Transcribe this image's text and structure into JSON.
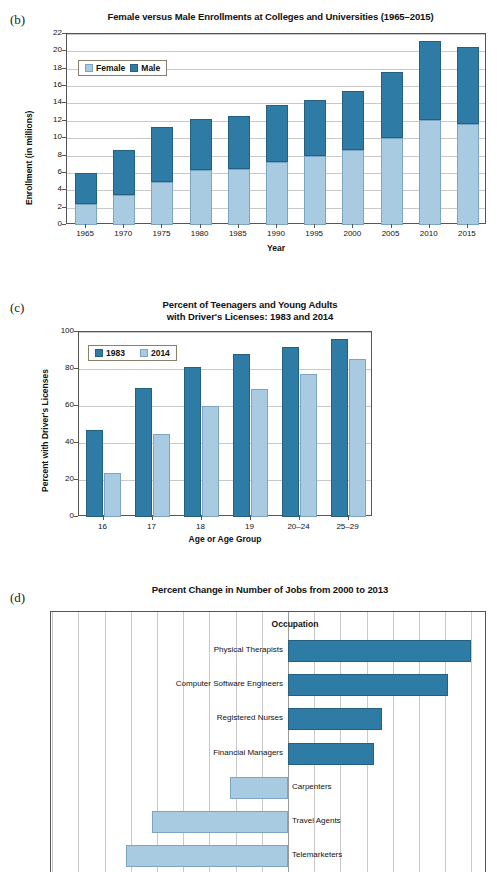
{
  "page": {
    "background": "#ffffff",
    "colors": {
      "dark_blue": "#2e7ba6",
      "light_blue": "#a8cbe2",
      "grid": "#c8c8c8",
      "axis": "#555555"
    }
  },
  "panel_b": {
    "tag": "(b)",
    "title": "Female versus Male Enrollments at Colleges and Universities (1965–2015)",
    "legend": [
      {
        "label": "Female",
        "color": "#a8cbe2"
      },
      {
        "label": "Male",
        "color": "#2e7ba6"
      }
    ],
    "ylabel": "Enrollment (in millions)",
    "xlabel": "Year"
  },
  "panel_c": {
    "tag": "(c)",
    "title_line1": "Percent of Teenagers and Young Adults",
    "title_line2": "with Driver's Licenses: 1983 and 2014",
    "legend": [
      {
        "label": "1983",
        "color": "#2e7ba6"
      },
      {
        "label": "2014",
        "color": "#a8cbe2"
      }
    ],
    "ylabel": "Percent with Driver's Licenses",
    "xlabel": "Age or Age Group"
  },
  "panel_d": {
    "tag": "(d)",
    "title": "Percent Change in Number of Jobs from 2000 to 2013",
    "column_header": "Occupation"
  },
  "chart_data": [
    {
      "id": "b",
      "type": "bar",
      "subtype": "stacked-vertical",
      "title": "Female versus Male Enrollments at Colleges and Universities (1965–2015)",
      "xlabel": "Year",
      "ylabel": "Enrollment (in millions)",
      "ylim": [
        0,
        22
      ],
      "yticks": [
        0,
        2,
        4,
        6,
        8,
        10,
        12,
        14,
        16,
        18,
        20,
        22
      ],
      "grid": true,
      "legend_position": "top-left",
      "categories": [
        "1965",
        "1970",
        "1975",
        "1980",
        "1985",
        "1990",
        "1995",
        "2000",
        "2005",
        "2010",
        "2015"
      ],
      "series": [
        {
          "name": "Female",
          "color": "#a8cbe2",
          "values": [
            2.4,
            3.5,
            5.0,
            6.3,
            6.4,
            7.3,
            7.9,
            8.6,
            10.0,
            12.1,
            11.6
          ]
        },
        {
          "name": "Male",
          "color": "#2e7ba6",
          "values": [
            3.6,
            5.1,
            6.3,
            5.9,
            6.1,
            6.5,
            6.5,
            6.8,
            7.6,
            9.1,
            8.9
          ]
        }
      ],
      "totals": [
        6.0,
        8.6,
        11.3,
        12.2,
        12.5,
        13.8,
        14.4,
        15.4,
        17.6,
        21.2,
        20.5
      ]
    },
    {
      "id": "c",
      "type": "bar",
      "subtype": "grouped-vertical",
      "title": "Percent of Teenagers and Young Adults with Driver's Licenses: 1983 and 2014",
      "xlabel": "Age or Age Group",
      "ylabel": "Percent with Driver's Licenses",
      "ylim": [
        0,
        100
      ],
      "yticks": [
        0,
        20,
        40,
        60,
        80,
        100
      ],
      "grid": true,
      "legend_position": "top-left",
      "categories": [
        "16",
        "17",
        "18",
        "19",
        "20–24",
        "25–29"
      ],
      "series": [
        {
          "name": "1983",
          "color": "#2e7ba6",
          "values": [
            47,
            70,
            81,
            88,
            92,
            96
          ]
        },
        {
          "name": "2014",
          "color": "#a8cbe2",
          "values": [
            24,
            45,
            60,
            69,
            77.5,
            85.5
          ]
        }
      ]
    },
    {
      "id": "d",
      "type": "bar",
      "subtype": "horizontal-diverging",
      "title": "Percent Change in Number of Jobs from 2000 to 2013",
      "column_header": "Occupation",
      "xlabel": "",
      "ylabel": "Occupation",
      "grid": true,
      "note": "x-axis tick labels are cut off at the bottom of the screenshot",
      "categories": [
        "Physical Therapists",
        "Computer Software Engineers",
        "Registered Nurses",
        "Financial Managers",
        "Carpenters",
        "Travel Agents",
        "Telemarketers"
      ],
      "values": [
        70,
        61,
        36,
        33,
        -22,
        -52,
        -62
      ],
      "colors": [
        "#2e7ba6",
        "#2e7ba6",
        "#2e7ba6",
        "#2e7ba6",
        "#a8cbe2",
        "#a8cbe2",
        "#a8cbe2"
      ]
    }
  ]
}
